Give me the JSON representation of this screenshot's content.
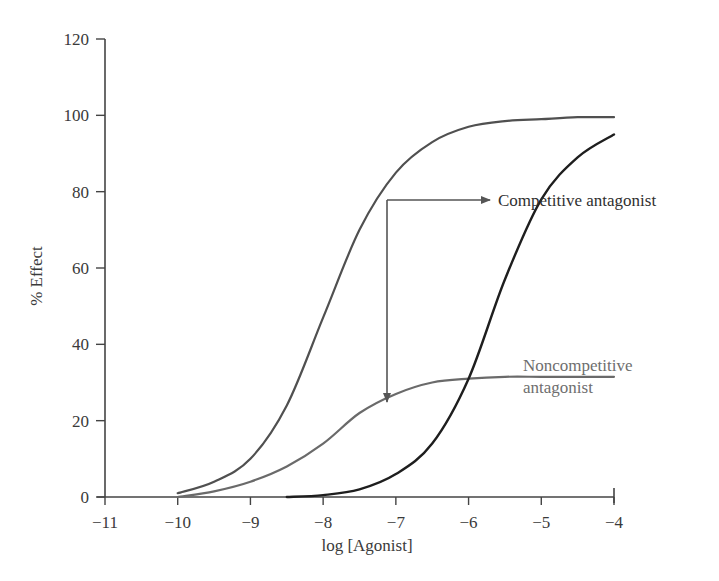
{
  "chart_data": {
    "type": "line",
    "title": "",
    "xlabel": "log [Agonist]",
    "ylabel": "% Effect",
    "xlim": [
      -11,
      -4
    ],
    "ylim": [
      0,
      120
    ],
    "grid": false,
    "legend": "none (inline annotations)",
    "x_ticks": [
      "−11",
      "−10",
      "−9",
      "−8",
      "−7",
      "−6",
      "−5",
      "−4"
    ],
    "y_ticks": [
      "0",
      "20",
      "40",
      "60",
      "80",
      "100",
      "120"
    ],
    "series": [
      {
        "name": "Agonist alone",
        "color": "#505050",
        "x": [
          -10,
          -9.5,
          -9,
          -8.5,
          -8,
          -7.5,
          -7,
          -6.5,
          -6,
          -5.5,
          -5,
          -4.5,
          -4
        ],
        "y": [
          1,
          4,
          10,
          24,
          47,
          70,
          85,
          93,
          97,
          98.5,
          99,
          99.5,
          99.5
        ]
      },
      {
        "name": "Agonist + noncompetitive antagonist",
        "color": "#6a6a6a",
        "x": [
          -10,
          -9.5,
          -9,
          -8.5,
          -8,
          -7.5,
          -7,
          -6.5,
          -6,
          -5.5,
          -5,
          -4.5,
          -4
        ],
        "y": [
          0,
          1.5,
          4,
          8,
          14,
          22,
          27,
          30,
          31,
          31.5,
          31.5,
          31.5,
          31.5
        ]
      },
      {
        "name": "Agonist + competitive antagonist",
        "color": "#1e1e1e",
        "x": [
          -8.5,
          -8,
          -7.5,
          -7,
          -6.5,
          -6,
          -5.5,
          -5,
          -4.5,
          -4
        ],
        "y": [
          0,
          0.5,
          2,
          6,
          14,
          31,
          57,
          78,
          89,
          95
        ]
      }
    ],
    "annotations": [
      {
        "text": "Competitive antagonist",
        "arrow_from": [
          -7.2,
          78
        ],
        "arrow_to": [
          -5.2,
          78
        ]
      },
      {
        "text": "Noncompetitive antagonist",
        "lines": [
          "Noncompetitive",
          "antagonist"
        ],
        "arrow_from": [
          -7.2,
          78
        ],
        "arrow_to": [
          -7.2,
          25
        ]
      }
    ]
  },
  "labels": {
    "xlabel": "log [Agonist]",
    "ylabel": "% Effect",
    "competitive": "Competitive antagonist",
    "noncompetitive_line1": "Noncompetitive",
    "noncompetitive_line2": "antagonist"
  }
}
